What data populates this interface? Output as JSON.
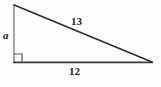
{
  "figure": {
    "type": "right-triangle-diagram",
    "background_color": "#fdfdfd",
    "stroke_color_base": "#3a3a3a",
    "stroke_color_leg": "#8f8f93",
    "stroke_color_hypotenuse": "#2e2e2e",
    "right_angle_color": "#55555a",
    "labels": {
      "vertical_leg": "a",
      "horizontal_leg": "12",
      "hypotenuse": "13"
    },
    "vertices": {
      "top_left": {
        "x": 14,
        "y": 5
      },
      "bottom_left": {
        "x": 14,
        "y": 62
      },
      "bottom_right": {
        "x": 152,
        "y": 62
      }
    },
    "right_angle_marker": {
      "corner": "bottom-left",
      "size": 8
    }
  }
}
